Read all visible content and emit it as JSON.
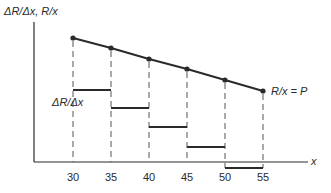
{
  "chart_data": {
    "type": "line",
    "title": "",
    "xlabel": "x",
    "ylabel": "ΔR/Δx, R/x",
    "x": [
      30,
      35,
      40,
      45,
      50,
      55
    ],
    "xticks": [
      "30",
      "35",
      "40",
      "45",
      "50",
      "55"
    ],
    "grid": false,
    "series": [
      {
        "name": "R/x = P",
        "style": "line-with-points",
        "x": [
          30,
          35,
          40,
          45,
          50,
          55
        ],
        "y_pixel": [
          38,
          48,
          59,
          69,
          80,
          91
        ]
      },
      {
        "name": "ΔR/Δx",
        "style": "step-segments",
        "intervals": [
          [
            30,
            35
          ],
          [
            35,
            40
          ],
          [
            40,
            45
          ],
          [
            45,
            50
          ],
          [
            50,
            55
          ]
        ],
        "y_pixel": [
          90,
          108,
          127,
          147,
          168
        ]
      }
    ],
    "annotations": [
      {
        "text": "R/x = P",
        "near": "end of line"
      },
      {
        "text": "ΔR/Δx",
        "near": "first step segment"
      }
    ],
    "dashed_guides": true
  },
  "labels": {
    "yaxis": "ΔR/Δx, R/x",
    "xaxis": "x",
    "line_label": "R/x = P",
    "step_label": "ΔR/Δx"
  },
  "colors": {
    "ink": "#2a2a2a",
    "guide": "#555555",
    "background": "#ffffff"
  }
}
